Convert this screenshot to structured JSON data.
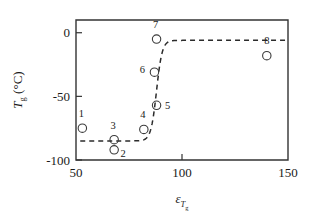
{
  "chart_data": {
    "type": "scatter",
    "title": "",
    "subtitle": "",
    "xlabel": "ε",
    "xlabel_sub": "T",
    "xlabel_sub_sub": "g",
    "ylabel": "T",
    "ylabel_sub": "g",
    "ylabel_unit": "(°C)",
    "xlim": [
      50,
      150
    ],
    "ylim": [
      -100,
      10
    ],
    "xticks": [
      50,
      100,
      150
    ],
    "xticklabels": [
      "50",
      "100",
      "150"
    ],
    "yticks": [
      0,
      -50,
      -100
    ],
    "yticklabels": [
      "0",
      "-50",
      "-100"
    ],
    "grid": false,
    "legend": "none",
    "marker": "open-circle",
    "points": [
      {
        "label": "1",
        "x": 53,
        "y": -75,
        "label_dx": -1,
        "label_dy": -11
      },
      {
        "label": "2",
        "x": 68,
        "y": -92,
        "label_dx": 9,
        "label_dy": 7
      },
      {
        "label": "3",
        "x": 68,
        "y": -84,
        "label_dx": -1,
        "label_dy": -11
      },
      {
        "label": "4",
        "x": 82,
        "y": -76,
        "label_dx": -1,
        "label_dy": -11
      },
      {
        "label": "5",
        "x": 88,
        "y": -57,
        "label_dx": 11,
        "label_dy": 4
      },
      {
        "label": "6",
        "x": 87,
        "y": -31,
        "label_dx": -12,
        "label_dy": 1
      },
      {
        "label": "7",
        "x": 88,
        "y": -5,
        "label_dx": -1,
        "label_dy": -11
      },
      {
        "label": "8",
        "x": 140,
        "y": -18,
        "label_dx": 0,
        "label_dy": -12
      }
    ],
    "fit_curve": {
      "description": "sigmoidal dashed fit",
      "lower_plateau": -85,
      "upper_plateau": -6,
      "midpoint_x": 88,
      "steepness": 0.75,
      "x_start": 52,
      "x_end": 150
    },
    "colors": {
      "axis": "#333333",
      "marker": "#3a3a3a",
      "curve": "#2b2b2b",
      "text": "#1a1a1a",
      "background": "#ffffff"
    }
  }
}
